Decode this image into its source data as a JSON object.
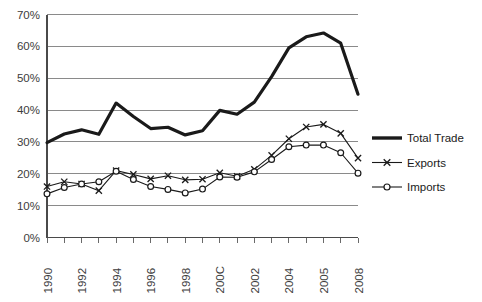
{
  "chart_data": {
    "type": "line",
    "title": "",
    "subtitle": "",
    "xlabel": "",
    "ylabel": "",
    "grid": true,
    "legend_position": "right",
    "xlim": [
      1990,
      2008
    ],
    "ylim": [
      0,
      70
    ],
    "y_tick_labels": [
      "70%",
      "60%",
      "50%",
      "40%",
      "30%",
      "20%",
      "10%",
      "0%"
    ],
    "y_tick_values": [
      70,
      60,
      50,
      40,
      30,
      20,
      10,
      0
    ],
    "x_tick_labels": [
      "1990",
      "1992",
      "1994",
      "1996",
      "1998",
      "200C",
      "2002",
      "2004",
      "2005",
      "2008"
    ],
    "x_tick_values": [
      1990,
      1992,
      1994,
      1996,
      1998,
      2000,
      2002,
      2004,
      2006,
      2008
    ],
    "x": [
      1990,
      1991,
      1992,
      1993,
      1994,
      1995,
      1996,
      1997,
      1998,
      1999,
      2000,
      2001,
      2002,
      2003,
      2004,
      2005,
      2006,
      2007,
      2008
    ],
    "series": [
      {
        "name": "Total Trade",
        "marker": "none",
        "style": "thick-line",
        "values": [
          29.8,
          32.5,
          33.8,
          32.4,
          42.2,
          38.0,
          34.2,
          34.6,
          32.2,
          33.5,
          39.9,
          38.7,
          42.5,
          50.5,
          59.5,
          63.0,
          64.2,
          61.0,
          45.0
        ]
      },
      {
        "name": "Exports",
        "marker": "x",
        "style": "thin-line-marker",
        "values": [
          16.0,
          17.5,
          16.8,
          14.7,
          21.0,
          19.8,
          18.4,
          19.4,
          18.1,
          18.3,
          20.3,
          19.2,
          21.4,
          25.8,
          31.0,
          34.7,
          35.5,
          32.7,
          24.9
        ]
      },
      {
        "name": "Imports",
        "marker": "o",
        "style": "thin-line-marker",
        "values": [
          13.7,
          15.7,
          16.8,
          17.5,
          20.8,
          18.2,
          16.0,
          15.1,
          14.0,
          15.2,
          19.0,
          18.9,
          20.6,
          24.5,
          28.5,
          29.0,
          29.0,
          26.6,
          20.2
        ]
      }
    ]
  },
  "legend": {
    "items": [
      {
        "label": "Total Trade",
        "marker": "none",
        "color": "#1a1a1a"
      },
      {
        "label": "Exports",
        "marker": "x",
        "color": "#1a1a1a"
      },
      {
        "label": "Imports",
        "marker": "o",
        "color": "#1a1a1a"
      }
    ]
  },
  "colors": {
    "line": "#1a1a1a",
    "grid": "#8a8a8a",
    "axis": "#4a4a4a",
    "text": "#3c3c3c",
    "background": "#ffffff"
  }
}
